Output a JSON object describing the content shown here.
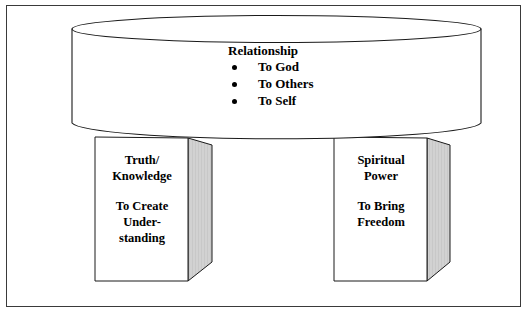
{
  "diagram": {
    "type": "conceptual-diagram",
    "background_color": "#ffffff",
    "border_color": "#3a3a3a",
    "shading_color": "#d0d0d0",
    "line_color": "#1a1a1a",
    "tabletop": {
      "shape": "cylinder",
      "heading": "Relationship",
      "bullets": [
        {
          "marker": "•",
          "label": "To God"
        },
        {
          "marker": "•",
          "label": "To Others"
        },
        {
          "marker": "•",
          "label": "To Self"
        }
      ]
    },
    "legs": [
      {
        "id": "left",
        "shape": "3d-rectangular-leg",
        "title_lines": [
          "Truth/",
          "Knowledge"
        ],
        "purpose_lines": [
          "To Create",
          "Under-",
          "standing"
        ]
      },
      {
        "id": "right",
        "shape": "3d-rectangular-leg",
        "title_lines": [
          "Spiritual",
          "Power"
        ],
        "purpose_lines": [
          "To Bring",
          "Freedom"
        ]
      }
    ]
  }
}
